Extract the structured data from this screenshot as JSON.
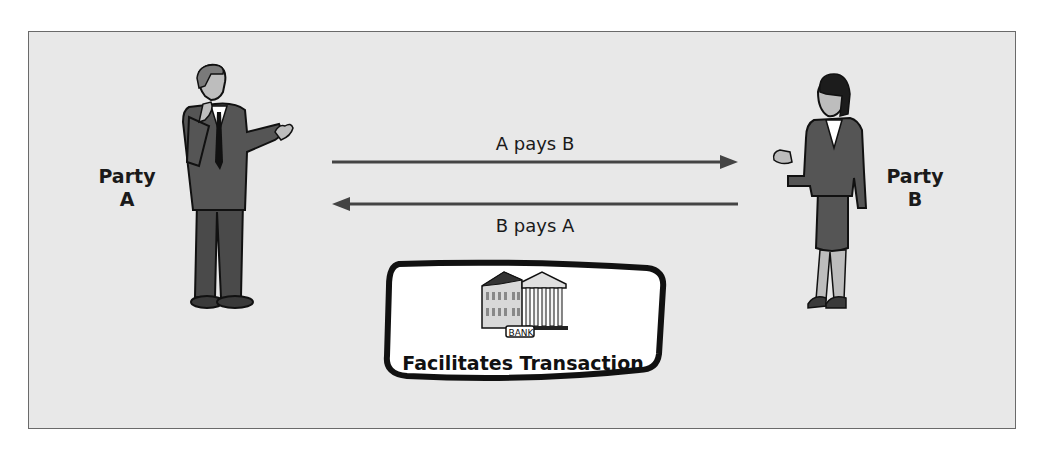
{
  "diagram": {
    "parties": [
      {
        "id": "A",
        "label_line1": "Party",
        "label_line2": "A",
        "figure": "man-in-suit"
      },
      {
        "id": "B",
        "label_line1": "Party",
        "label_line2": "B",
        "figure": "woman-in-suit"
      }
    ],
    "flows": [
      {
        "from": "A",
        "to": "B",
        "label": "A pays B",
        "direction": "right"
      },
      {
        "from": "B",
        "to": "A",
        "label": "B pays A",
        "direction": "left"
      }
    ],
    "intermediary": {
      "icon": "bank-building-icon",
      "sign_text": "BANK",
      "caption": "Facilitates Transaction"
    },
    "colors": {
      "background": "#e8e8e8",
      "frame_border": "#6a6a6a",
      "suit": "#555555",
      "arrow": "#444444",
      "bank_box_fill": "#ffffff",
      "bank_box_border": "#111111"
    }
  }
}
